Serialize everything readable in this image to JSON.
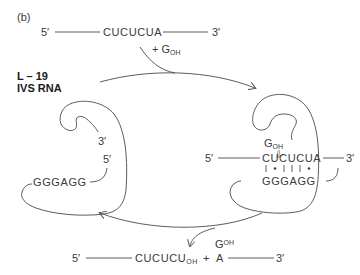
{
  "figure": {
    "panel_label": "(b)",
    "enzyme_label_line1": "L – 19",
    "enzyme_label_line2": "IVS RNA"
  },
  "substrate": {
    "five_prime": "5′",
    "sequence": "CUCUCUA",
    "three_prime": "3′",
    "cofactor_plus": "+ G",
    "cofactor_sub": "OH"
  },
  "free_enzyme": {
    "three_prime": "3′",
    "five_prime": "5′",
    "guide_sequence": "GGGAGG"
  },
  "complex": {
    "g_label": "G",
    "g_sub": "OH",
    "five_prime": "5′",
    "substrate_sequence": "CUCUCUA",
    "three_prime": "3′",
    "guide_sequence": "GGGAGG",
    "pairing": [
      "|",
      "•",
      "|",
      "|",
      "|",
      "•"
    ]
  },
  "products": {
    "five_prime": "5′",
    "product1_sequence": "CUCUCU",
    "product1_sub": "OH",
    "plus": "+",
    "g_label": "G",
    "g_sup": "OH",
    "product2_base": "A",
    "three_prime": "3′"
  }
}
